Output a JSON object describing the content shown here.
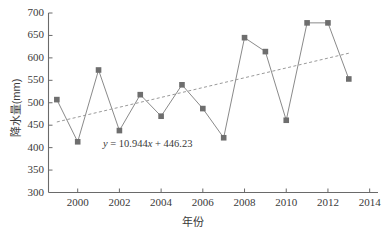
{
  "chart_data": {
    "type": "line",
    "title": "",
    "xlabel": "年份",
    "ylabel": "降水量(mm)",
    "xlim": [
      1998.6,
      2014.4
    ],
    "ylim": [
      300,
      700
    ],
    "yticks": [
      300,
      350,
      400,
      450,
      500,
      550,
      600,
      650,
      700
    ],
    "xticks": [
      2000,
      2002,
      2004,
      2006,
      2008,
      2010,
      2012,
      2014
    ],
    "grid": false,
    "legend": null,
    "series": [
      {
        "name": "降水量",
        "marker": "square",
        "color": "#6e6e6e",
        "x": [
          1999,
          2000,
          2001,
          2002,
          2003,
          2004,
          2005,
          2006,
          2007,
          2008,
          2009,
          2010,
          2011,
          2012,
          2013
        ],
        "values": [
          507,
          413,
          573,
          438,
          518,
          470,
          540,
          487,
          422,
          645,
          614,
          461,
          678,
          678,
          553
        ]
      }
    ],
    "trendline": {
      "style": "dashed",
      "color": "#8a8a8a",
      "equation": "y = 10.944x + 446.23",
      "slope": 10.944,
      "intercept": 446.23,
      "x_start": 1999,
      "x_end": 2013,
      "y_start": 457.17,
      "y_end": 610.4
    },
    "annotations": [
      {
        "name": "trend-equation",
        "text": "y = 10.944x + 446.23",
        "x": 2002.4,
        "y": 405
      }
    ]
  },
  "axis": {
    "y_tick_labels": [
      "700",
      "650",
      "600",
      "550",
      "500",
      "450",
      "400",
      "350",
      "300"
    ],
    "x_tick_labels": [
      "2000",
      "2002",
      "2004",
      "2006",
      "2008",
      "2010",
      "2012",
      "2014"
    ],
    "y_title": "降水量(mm)",
    "x_title": "年份"
  },
  "equation": {
    "prefix": "y",
    "body": " = 10.944",
    "xvar": "x",
    "suffix": " + 446.23"
  },
  "colors": {
    "marker": "#6e6e6e",
    "line": "#8a8a8a",
    "trend": "#9a9a9a",
    "axis": "#6a6a6a",
    "text": "#3a3a3a",
    "background": "#ffffff"
  }
}
